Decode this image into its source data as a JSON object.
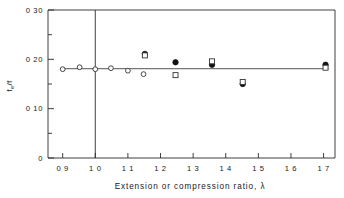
{
  "chart_data": {
    "type": "scatter",
    "title": "",
    "xlabel": "Extension or compression ratio, λ",
    "ylabel": "fₑ/f",
    "xlim": [
      0.855,
      1.735
    ],
    "ylim": [
      0,
      0.3
    ],
    "grid": false,
    "legend": "none",
    "x_ticks": [
      {
        "value": 0.9,
        "label": "0 9",
        "major": true
      },
      {
        "value": 1.0,
        "label": "1 0",
        "major": true
      },
      {
        "value": 1.1,
        "label": "1 1",
        "major": true
      },
      {
        "value": 1.2,
        "label": "1 2",
        "major": true
      },
      {
        "value": 1.3,
        "label": "1 3",
        "major": true
      },
      {
        "value": 1.4,
        "label": "1 4",
        "major": true
      },
      {
        "value": 1.5,
        "label": "1 5",
        "major": true
      },
      {
        "value": 1.6,
        "label": "1 6",
        "major": true
      },
      {
        "value": 1.7,
        "label": "1 7",
        "major": true
      }
    ],
    "y_ticks": [
      {
        "value": 0.0,
        "label": "0",
        "major": true
      },
      {
        "value": 0.05,
        "label": "",
        "major": false
      },
      {
        "value": 0.1,
        "label": "0 10",
        "major": true
      },
      {
        "value": 0.15,
        "label": "",
        "major": false
      },
      {
        "value": 0.2,
        "label": "0 20",
        "major": true
      },
      {
        "value": 0.25,
        "label": "",
        "major": false
      },
      {
        "value": 0.3,
        "label": "0 30",
        "major": true
      }
    ],
    "reference_line_x": 1.0,
    "trend_line": {
      "y": 0.181,
      "x_start": 0.9,
      "x_end": 1.715
    },
    "series": [
      {
        "name": "open-circle",
        "marker": "open-circle",
        "points": [
          {
            "x": 0.9,
            "y": 0.18
          },
          {
            "x": 0.952,
            "y": 0.184
          },
          {
            "x": 1.0,
            "y": 0.18
          },
          {
            "x": 1.048,
            "y": 0.182
          },
          {
            "x": 1.1,
            "y": 0.177
          },
          {
            "x": 1.148,
            "y": 0.17
          }
        ]
      },
      {
        "name": "filled-circle",
        "marker": "filled-circle",
        "points": [
          {
            "x": 1.152,
            "y": 0.211
          },
          {
            "x": 1.246,
            "y": 0.194
          },
          {
            "x": 1.358,
            "y": 0.189
          },
          {
            "x": 1.452,
            "y": 0.15
          },
          {
            "x": 1.706,
            "y": 0.189
          }
        ]
      },
      {
        "name": "open-square",
        "marker": "open-square",
        "points": [
          {
            "x": 1.152,
            "y": 0.208
          },
          {
            "x": 1.246,
            "y": 0.168
          },
          {
            "x": 1.358,
            "y": 0.196
          },
          {
            "x": 1.452,
            "y": 0.154
          },
          {
            "x": 1.706,
            "y": 0.183
          }
        ]
      }
    ]
  },
  "axes": {
    "x_title": "Extension or compression ratio, λ",
    "y_title_main": "f",
    "y_title_sub": "e",
    "y_title_tail": "/f"
  }
}
